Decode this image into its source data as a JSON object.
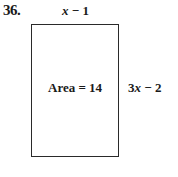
{
  "problem": {
    "number": "36.",
    "shape": "rectangle",
    "top_side": {
      "var": "x",
      "rest": " − 1"
    },
    "right_side": {
      "coef": "3",
      "var": "x",
      "rest": " − 2"
    },
    "area_label": "Area = 14"
  }
}
